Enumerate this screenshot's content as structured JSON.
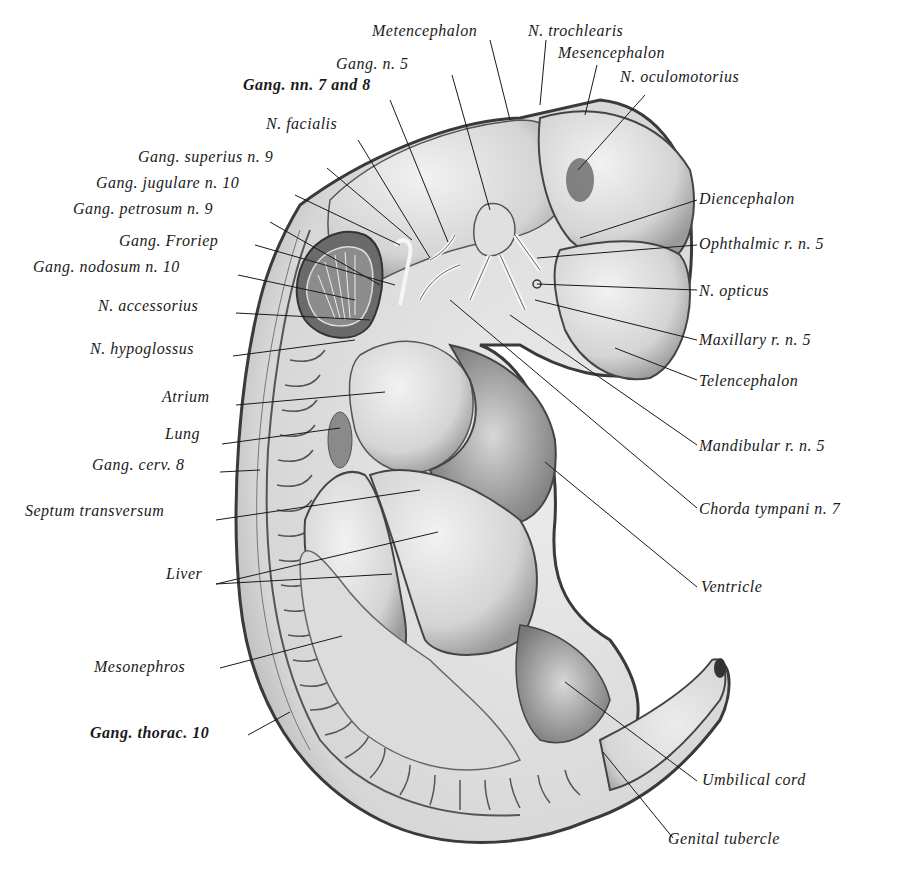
{
  "figure": {
    "colors": {
      "background": "#ffffff",
      "ink": "#1a1a1a",
      "tissue_light": "#e6e6e6",
      "tissue_mid": "#bdbdbd",
      "tissue_dark": "#6e6e6e"
    }
  },
  "labels": {
    "metencephalon": "Metencephalon",
    "n_trochlearis": "N. trochlearis",
    "mesencephalon": "Mesencephalon",
    "n_oculomotorius": "N. oculomotorius",
    "gang_n5": "Gang. n. 5",
    "gang_nn7_8": "Gang. nn. 7 and 8",
    "n_facialis": "N. facialis",
    "gang_superius_n9": "Gang. superius n. 9",
    "gang_jugulare_n10": "Gang. jugulare n. 10",
    "gang_petrosum_n9": "Gang. petrosum n. 9",
    "gang_froriep": "Gang. Froriep",
    "gang_nodosum_n10": "Gang. nodosum n. 10",
    "n_accessorius": "N. accessorius",
    "n_hypoglossus": "N. hypoglossus",
    "atrium": "Atrium",
    "lung": "Lung",
    "gang_cerv8": "Gang. cerv. 8",
    "septum_transversum": "Septum transversum",
    "liver": "Liver",
    "mesonephros": "Mesonephros",
    "gang_thorac10": "Gang. thorac. 10",
    "diencephalon": "Diencephalon",
    "ophthalmic": "Ophthalmic r. n. 5",
    "n_opticus": "N. opticus",
    "maxillary": "Maxillary r. n. 5",
    "telencephalon": "Telencephalon",
    "mandibular": "Mandibular r. n. 5",
    "chorda_tympani": "Chorda tympani n. 7",
    "ventricle": "Ventricle",
    "umbilical_cord": "Umbilical cord",
    "genital_tubercle": "Genital tubercle"
  }
}
